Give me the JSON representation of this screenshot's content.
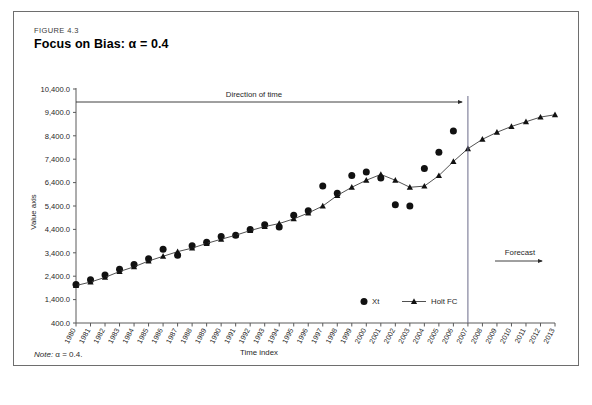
{
  "figure": {
    "number": "FIGURE 4.3",
    "title": "Focus on Bias: α = 0.4",
    "note_label": "Note:",
    "note_text": " α = 0.4."
  },
  "annotations": {
    "direction_of_time": "Direction of time",
    "forecast": "Forecast",
    "forecast_boundary_year": 2007
  },
  "legend": {
    "position": "inside-bottom-center",
    "entries": [
      {
        "label": "Xt",
        "marker": "circle"
      },
      {
        "label": "Holt FC",
        "marker": "triangle-line"
      }
    ]
  },
  "chart_data": {
    "type": "line",
    "title": "Focus on Bias: α = 0.4",
    "xlabel": "Time index",
    "ylabel": "Value axis",
    "grid": false,
    "xlim": [
      1980,
      2013
    ],
    "ylim": [
      400,
      10400
    ],
    "ytick_labels": [
      "400.0",
      "1,400.0",
      "2,400.0",
      "3,400.0",
      "4,400.0",
      "5,400.0",
      "6,400.0",
      "7,400.0",
      "8,400.0",
      "9,400.0",
      "10,400.0"
    ],
    "yticks": [
      400,
      1400,
      2400,
      3400,
      4400,
      5400,
      6400,
      7400,
      8400,
      9400,
      10400
    ],
    "x": [
      1980,
      1981,
      1982,
      1983,
      1984,
      1985,
      1986,
      1987,
      1988,
      1989,
      1990,
      1991,
      1992,
      1993,
      1994,
      1995,
      1996,
      1997,
      1998,
      1999,
      2000,
      2001,
      2002,
      2003,
      2004,
      2005,
      2006,
      2007,
      2008,
      2009,
      2010,
      2011,
      2012,
      2013
    ],
    "categories": [
      "1980",
      "1981",
      "1982",
      "1983",
      "1984",
      "1985",
      "1986",
      "1987",
      "1988",
      "1989",
      "1990",
      "1991",
      "1992",
      "1993",
      "1994",
      "1995",
      "1996",
      "1997",
      "1998",
      "1999",
      "2000",
      "2001",
      "2002",
      "2003",
      "2004",
      "2005",
      "2006",
      "2007",
      "2008",
      "2009",
      "2010",
      "2011",
      "2012",
      "2013"
    ],
    "series": [
      {
        "name": "Xt",
        "marker": "circle",
        "values": [
          2050,
          2250,
          2450,
          2700,
          2900,
          3150,
          3550,
          3300,
          3700,
          3850,
          4100,
          4150,
          4400,
          4600,
          4500,
          5000,
          5200,
          6250,
          5950,
          6700,
          6850,
          6600,
          5450,
          5400,
          7000,
          7700,
          8600,
          null,
          null,
          null,
          null,
          null,
          null,
          null
        ]
      },
      {
        "name": "Holt FC",
        "marker": "triangle",
        "values": [
          2000,
          2150,
          2350,
          2600,
          2800,
          3050,
          3250,
          3450,
          3600,
          3800,
          3980,
          4150,
          4350,
          4520,
          4650,
          4850,
          5100,
          5400,
          5850,
          6200,
          6500,
          6750,
          6500,
          6200,
          6250,
          6700,
          7300,
          7850,
          8250,
          8550,
          8800,
          9000,
          9200,
          9300
        ]
      }
    ]
  }
}
